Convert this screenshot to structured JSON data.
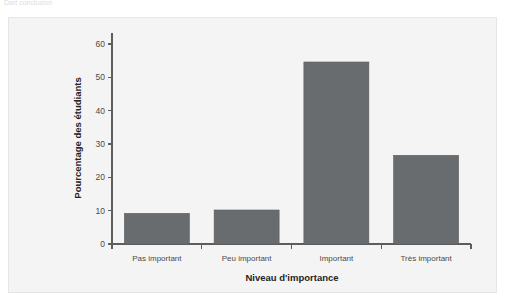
{
  "page": {
    "clipped_header_text": "Dart conclusion"
  },
  "chart_data": {
    "type": "bar",
    "title": "",
    "subtitle": "",
    "categories": [
      "Pas important",
      "Peu important",
      "Important",
      "Très important"
    ],
    "values": [
      9.2,
      10.2,
      54.6,
      26.6
    ],
    "series": [
      {
        "name": "Pourcentage des étudiants",
        "values": [
          9.2,
          10.2,
          54.6,
          26.6
        ]
      }
    ],
    "xlabel": "Niveau d'importance",
    "ylabel": "Pourcentage des étudiants",
    "ylim": [
      0,
      60
    ],
    "yticks": [
      0,
      10,
      20,
      30,
      40,
      50,
      60
    ],
    "ytick_labels": [
      "0",
      "10",
      "20",
      "30",
      "40",
      "50",
      "60"
    ],
    "grid": false,
    "legend": false,
    "legend_position": "none",
    "bar_color": "#686c6f",
    "plot_background": "#f4f4f4",
    "axis_color": "#5d5d5d"
  }
}
